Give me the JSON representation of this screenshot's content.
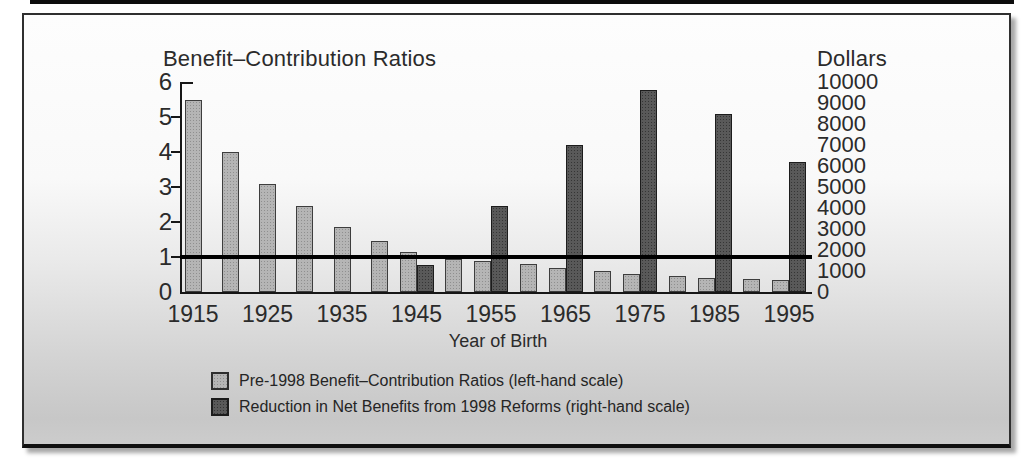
{
  "figure": {
    "left_title": "Benefit–Contribution Ratios",
    "right_title": "Dollars",
    "x_axis_title": "Year of Birth"
  },
  "chart_data": {
    "type": "bar",
    "title": "Benefit–Contribution Ratios",
    "xlabel": "Year of Birth",
    "left_axis": {
      "label": "Benefit–Contribution Ratios",
      "ticks": [
        0,
        1,
        2,
        3,
        4,
        5,
        6
      ],
      "range": [
        0,
        6
      ]
    },
    "right_axis": {
      "label": "Dollars",
      "ticks": [
        0,
        1000,
        2000,
        3000,
        4000,
        5000,
        6000,
        7000,
        8000,
        9000,
        10000
      ],
      "range": [
        0,
        10000
      ]
    },
    "x_tick_labels": [
      "1915",
      "1925",
      "1935",
      "1945",
      "1955",
      "1965",
      "1975",
      "1985",
      "1995"
    ],
    "grid": false,
    "legend_position": "bottom",
    "reference_line": {
      "scale": "left",
      "value": 1.0,
      "color": "#000000"
    },
    "series": [
      {
        "name": "Pre-1998 Benefit–Contribution Ratios (left-hand scale)",
        "scale": "left",
        "color": "#b5b5b5",
        "x": [
          1915,
          1920,
          1925,
          1930,
          1935,
          1940,
          1945,
          1950,
          1955,
          1960,
          1965,
          1970,
          1975,
          1980,
          1985,
          1990,
          1995
        ],
        "values": [
          5.5,
          4.0,
          3.1,
          2.45,
          1.85,
          1.45,
          1.15,
          0.95,
          0.88,
          0.8,
          0.7,
          0.6,
          0.52,
          0.46,
          0.4,
          0.37,
          0.35
        ]
      },
      {
        "name": "Reduction in Net Benefits from 1998 Reforms (right-hand scale)",
        "scale": "right",
        "color": "#595959",
        "x": [
          1945,
          1955,
          1965,
          1975,
          1985,
          1995
        ],
        "values": [
          1300,
          4100,
          7000,
          9600,
          8500,
          6200
        ]
      }
    ]
  }
}
